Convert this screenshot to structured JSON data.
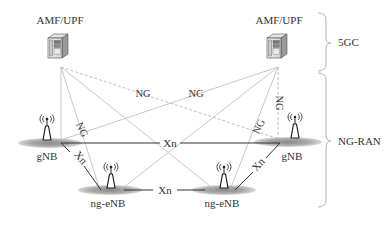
{
  "diagram": {
    "core_label": "5GC",
    "ran_label": "NG-RAN",
    "core_nodes": [
      {
        "id": "amf-left",
        "label": "AMF/UPF"
      },
      {
        "id": "amf-right",
        "label": "AMF/UPF"
      }
    ],
    "ran_nodes": [
      {
        "id": "gnb-left",
        "label": "gNB"
      },
      {
        "id": "gnb-right",
        "label": "gNB"
      },
      {
        "id": "ngenb-left",
        "label": "ng-eNB"
      },
      {
        "id": "ngenb-right",
        "label": "ng-eNB"
      }
    ],
    "interfaces": {
      "ng": "NG",
      "xn": "Xn"
    },
    "links": [
      {
        "from": "amf-left",
        "to": "gnb-left",
        "type": "NG",
        "labeled": false
      },
      {
        "from": "amf-left",
        "to": "ngenb-left",
        "type": "NG",
        "labeled": true
      },
      {
        "from": "amf-left",
        "to": "ngenb-right",
        "type": "NG",
        "labeled": false
      },
      {
        "from": "amf-left",
        "to": "gnb-right",
        "type": "NG",
        "labeled": true
      },
      {
        "from": "amf-right",
        "to": "gnb-left",
        "type": "NG",
        "labeled": true
      },
      {
        "from": "amf-right",
        "to": "ngenb-left",
        "type": "NG",
        "labeled": false
      },
      {
        "from": "amf-right",
        "to": "ngenb-right",
        "type": "NG",
        "labeled": true
      },
      {
        "from": "amf-right",
        "to": "gnb-right",
        "type": "NG",
        "labeled": true
      },
      {
        "from": "gnb-left",
        "to": "gnb-right",
        "type": "Xn",
        "labeled": true
      },
      {
        "from": "gnb-left",
        "to": "ngenb-left",
        "type": "Xn",
        "labeled": true
      },
      {
        "from": "ngenb-left",
        "to": "ngenb-right",
        "type": "Xn",
        "labeled": true
      },
      {
        "from": "ngenb-right",
        "to": "gnb-right",
        "type": "Xn",
        "labeled": true
      }
    ]
  }
}
